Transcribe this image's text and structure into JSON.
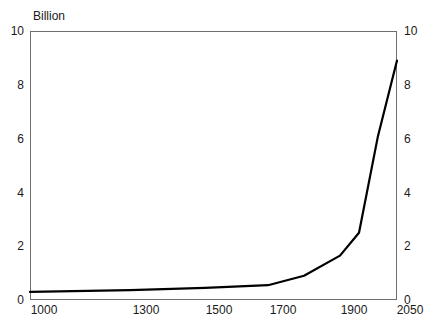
{
  "chart_data": {
    "type": "line",
    "title": "",
    "subtitle": "",
    "unit_label": "Billion",
    "xlabel": "",
    "ylabel": "",
    "ylim": [
      0,
      10
    ],
    "y_ticks": [
      0,
      2,
      4,
      6,
      8,
      10
    ],
    "y_tick_labels": [
      "0",
      "2",
      "4",
      "6",
      "8",
      "10"
    ],
    "dual_y_axis": true,
    "grid": false,
    "legend": null,
    "x_axis_type": "nonlinear-categorical",
    "x_tick_labels": [
      "1000",
      "1300",
      "1500",
      "1700",
      "1900",
      "2050"
    ],
    "x_tick_values": [
      1000,
      1300,
      1500,
      1700,
      1900,
      2050
    ],
    "x_tick_positions_px": [
      30,
      130,
      205,
      268,
      340,
      397
    ],
    "series": [
      {
        "name": "World population",
        "color": "#000000",
        "x": [
          1000,
          1300,
          1500,
          1700,
          1800,
          1900,
          1950,
          2000,
          2050
        ],
        "values": [
          0.3,
          0.37,
          0.45,
          0.55,
          0.9,
          1.65,
          2.5,
          6.1,
          8.9
        ]
      }
    ],
    "annotations": []
  },
  "axes": {
    "left_ticks": [
      {
        "label": "10",
        "value": 10,
        "y_px": 31
      },
      {
        "label": "8",
        "value": 8,
        "y_px": 85
      },
      {
        "label": "6",
        "value": 6,
        "y_px": 139
      },
      {
        "label": "4",
        "value": 4,
        "y_px": 193
      },
      {
        "label": "2",
        "value": 2,
        "y_px": 246
      },
      {
        "label": "0",
        "value": 0,
        "y_px": 300
      }
    ],
    "right_ticks": [
      {
        "label": "10",
        "value": 10,
        "y_px": 31
      },
      {
        "label": "8",
        "value": 8,
        "y_px": 85
      },
      {
        "label": "6",
        "value": 6,
        "y_px": 139
      },
      {
        "label": "4",
        "value": 4,
        "y_px": 193
      },
      {
        "label": "2",
        "value": 2,
        "y_px": 246
      },
      {
        "label": "0",
        "value": 0,
        "y_px": 300
      }
    ],
    "x_ticks": [
      {
        "label": "1000",
        "x_px": 44
      },
      {
        "label": "1300",
        "x_px": 146
      },
      {
        "label": "1500",
        "x_px": 219
      },
      {
        "label": "1700",
        "x_px": 283
      },
      {
        "label": "1900",
        "x_px": 354
      },
      {
        "label": "2050",
        "x_px": 410
      }
    ]
  },
  "style": {
    "line_color": "#000000",
    "frame_color": "#6e6e6e",
    "background": "#ffffff",
    "text_color": "#1a1a1a"
  }
}
